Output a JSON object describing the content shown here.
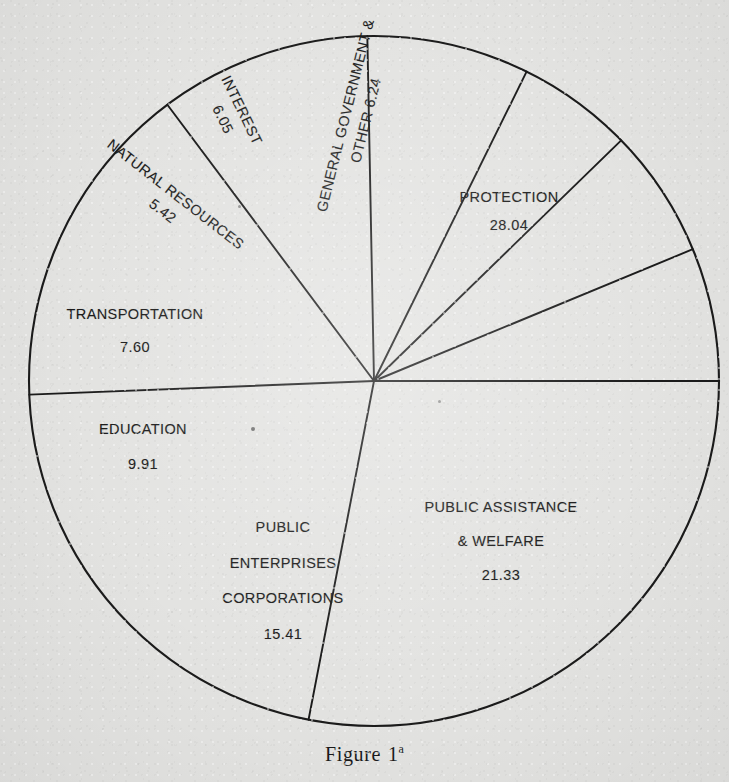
{
  "figure": {
    "caption_word": "Figure",
    "caption_number": "1",
    "caption_superscript": "a",
    "background_color": "#e3e3e1",
    "ink_color": "#1b1b1b"
  },
  "chart_data": {
    "type": "pie",
    "xlabel": "",
    "ylabel": "",
    "grid": false,
    "legend_position": "none",
    "value_total": 100.0,
    "units": "percent",
    "categories": [
      "PROTECTION",
      "PUBLIC ASSISTANCE & WELFARE",
      "PUBLIC ENTERPRISES CORPORATIONS",
      "EDUCATION",
      "TRANSPORTATION",
      "NATURAL RESOURCES",
      "INTEREST",
      "GENERAL GOVERNMENT & OTHER"
    ],
    "values": [
      28.04,
      21.33,
      15.41,
      9.91,
      7.6,
      5.42,
      6.05,
      6.24
    ],
    "slices": [
      {
        "name": "protection",
        "label_lines": [
          "PROTECTION"
        ],
        "value": "28.04",
        "value_number": 28.04,
        "start_angle_deg": 0,
        "end_angle_deg": 100.94,
        "rotation_deg": 0
      },
      {
        "name": "public-assistance-welfare",
        "label_lines": [
          "PUBLIC ASSISTANCE",
          "& WELFARE"
        ],
        "value": "21.33",
        "value_number": 21.33,
        "start_angle_deg": 100.94,
        "end_angle_deg": 177.73,
        "rotation_deg": 0
      },
      {
        "name": "public-enterprises-corporations",
        "label_lines": [
          "PUBLIC",
          "ENTERPRISES",
          "CORPORATIONS"
        ],
        "value": "15.41",
        "value_number": 15.41,
        "start_angle_deg": 177.73,
        "end_angle_deg": 233.21,
        "rotation_deg": 0
      },
      {
        "name": "education",
        "label_lines": [
          "EDUCATION"
        ],
        "value": "9.91",
        "value_number": 9.91,
        "start_angle_deg": 233.21,
        "end_angle_deg": 268.89,
        "rotation_deg": 0
      },
      {
        "name": "transportation",
        "label_lines": [
          "TRANSPORTATION"
        ],
        "value": "7.60",
        "value_number": 7.6,
        "start_angle_deg": 268.89,
        "end_angle_deg": 296.25,
        "rotation_deg": 0
      },
      {
        "name": "natural-resources",
        "label_lines": [
          "NATURAL RESOURCES"
        ],
        "value": "5.42",
        "value_number": 5.42,
        "start_angle_deg": 296.25,
        "end_angle_deg": 315.76,
        "rotation_deg": 38
      },
      {
        "name": "interest",
        "label_lines": [
          "INTEREST"
        ],
        "value": "6.05",
        "value_number": 6.05,
        "start_angle_deg": 315.76,
        "end_angle_deg": 337.54,
        "rotation_deg": 64
      },
      {
        "name": "general-government-other",
        "label_lines": [
          "GENERAL GOVERNMENT &",
          "OTHER 6.24"
        ],
        "value": "6.24",
        "value_number": 6.24,
        "start_angle_deg": 337.54,
        "end_angle_deg": 360,
        "rotation_deg": -76
      }
    ],
    "geometry": {
      "center_x": 374,
      "center_y": 381,
      "radius": 345
    }
  },
  "labels": {
    "protection": {
      "line1": "PROTECTION",
      "value": "28.04"
    },
    "public_assistance": {
      "line1": "PUBLIC ASSISTANCE",
      "line2": "& WELFARE",
      "value": "21.33"
    },
    "public_enterprises": {
      "line1": "PUBLIC",
      "line2": "ENTERPRISES",
      "line3": "CORPORATIONS",
      "value": "15.41"
    },
    "education": {
      "line1": "EDUCATION",
      "value": "9.91"
    },
    "transportation": {
      "line1": "TRANSPORTATION",
      "value": "7.60"
    },
    "natural_resources": {
      "line1": "NATURAL RESOURCES",
      "value": "5.42"
    },
    "interest": {
      "line1": "INTEREST",
      "value": "6.05"
    },
    "general_government": {
      "line1": "GENERAL GOVERNMENT &",
      "line2": "OTHER 6.24"
    }
  }
}
